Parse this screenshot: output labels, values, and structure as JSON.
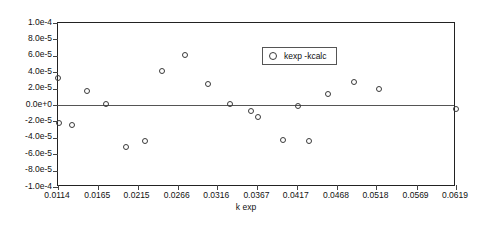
{
  "chart_data": {
    "type": "scatter",
    "title": "",
    "xlabel": "k exp",
    "ylabel": "",
    "xlim": [
      0.0114,
      0.0619
    ],
    "ylim": [
      -0.0001,
      0.0001
    ],
    "grid": false,
    "legend_position": "inside-top-right",
    "xticklabels": [
      "0.0114",
      "0.0165",
      "0.0215",
      "0.0266",
      "0.0316",
      "0.0367",
      "0.0417",
      "0.0468",
      "0.0518",
      "0.0569",
      "0.0619"
    ],
    "xtickvalues": [
      0.0114,
      0.0165,
      0.0215,
      0.0266,
      0.0316,
      0.0367,
      0.0417,
      0.0468,
      0.0518,
      0.0569,
      0.0619
    ],
    "yticklabels": [
      "1.0e-4",
      "8.0e-5",
      "6.0e-5",
      "4.0e-5",
      "2.0e-5",
      "0.0e+0",
      "-2.0e-5",
      "-4.0e-5",
      "-6.0e-5",
      "-8.0e-5",
      "-1.0e-4"
    ],
    "ytickvalues": [
      0.0001,
      8e-05,
      6e-05,
      4e-05,
      2e-05,
      0,
      -2e-05,
      -4e-05,
      -6e-05,
      -8e-05,
      -0.0001
    ],
    "series": [
      {
        "name": "kexp -kcalc",
        "marker": "open-circle",
        "color": "#3a3a3a",
        "points": [
          {
            "x": 0.0114,
            "y": 3.29e-05
          },
          {
            "x": 0.0115,
            "y": -2.2e-05
          },
          {
            "x": 0.0132,
            "y": -2.44e-05
          },
          {
            "x": 0.0151,
            "y": 1.71e-05
          },
          {
            "x": 0.0175,
            "y": 1.2e-06
          },
          {
            "x": 0.02,
            "y": -5.12e-05
          },
          {
            "x": 0.0224,
            "y": -4.39e-05
          },
          {
            "x": 0.0246,
            "y": 4.15e-05
          },
          {
            "x": 0.0275,
            "y": 6.1e-05
          },
          {
            "x": 0.0304,
            "y": 2.56e-05
          },
          {
            "x": 0.0332,
            "y": 1.2e-06
          },
          {
            "x": 0.0359,
            "y": -7.3e-06
          },
          {
            "x": 0.0368,
            "y": -1.46e-05
          },
          {
            "x": 0.04,
            "y": -4.27e-05
          },
          {
            "x": 0.0433,
            "y": -4.39e-05
          },
          {
            "x": 0.0419,
            "y": -1.2e-06
          },
          {
            "x": 0.0456,
            "y": 1.34e-05
          },
          {
            "x": 0.049,
            "y": 2.8e-05
          },
          {
            "x": 0.0521,
            "y": 1.95e-05
          },
          {
            "x": 0.0619,
            "y": -4.9e-06
          }
        ]
      }
    ]
  },
  "legend": {
    "entries": [
      {
        "label": "kexp -kcalc"
      }
    ]
  }
}
